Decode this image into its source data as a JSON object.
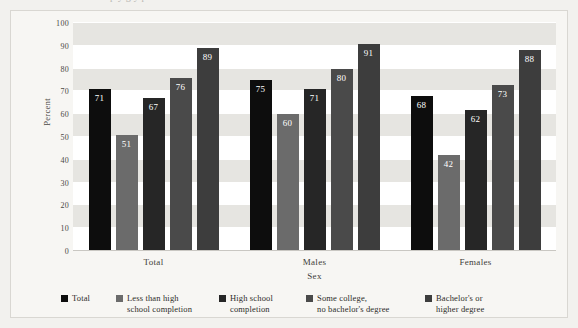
{
  "cut_title_fragment": "p y g y p",
  "chart_data": {
    "type": "bar",
    "title": "",
    "xlabel": "Sex",
    "ylabel": "Percent",
    "ylim": [
      0,
      100
    ],
    "ytick_step": 10,
    "yticks": [
      "100",
      "90",
      "80",
      "70",
      "60",
      "50",
      "40",
      "30",
      "20",
      "10",
      "0"
    ],
    "grid": true,
    "legend_position": "bottom",
    "categories": [
      "Total",
      "Males",
      "Females"
    ],
    "series": [
      {
        "name": "Total",
        "legend_label": "Total",
        "color": "#0d0d0d",
        "values": [
          71,
          75,
          68
        ]
      },
      {
        "name": "Less than high school completion",
        "legend_label": "Less than high\nschool completion",
        "color": "#6b6b6b",
        "values": [
          51,
          60,
          42
        ]
      },
      {
        "name": "High school completion",
        "legend_label": "High school\ncompletion",
        "color": "#262626",
        "values": [
          67,
          71,
          62
        ]
      },
      {
        "name": "Some college, no bachelor's degree",
        "legend_label": "Some college,\nno bachelor's degree",
        "color": "#4a4a4a",
        "values": [
          76,
          80,
          73
        ]
      },
      {
        "name": "Bachelor's or higher degree",
        "legend_label": "Bachelor's or\nhigher degree",
        "color": "#3d3d3d",
        "values": [
          89,
          91,
          88
        ]
      }
    ]
  }
}
